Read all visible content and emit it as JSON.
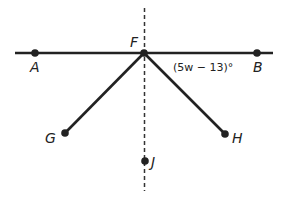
{
  "diagram": {
    "colors": {
      "line": "#222222",
      "background": "#ffffff"
    },
    "points": {
      "A": {
        "label": "A",
        "x": 35,
        "y": 53
      },
      "B": {
        "label": "B",
        "x": 257,
        "y": 53
      },
      "F": {
        "label": "F",
        "x": 144,
        "y": 53
      },
      "G": {
        "label": "G",
        "x": 65,
        "y": 133
      },
      "H": {
        "label": "H",
        "x": 225,
        "y": 134
      },
      "J": {
        "label": "J",
        "x": 145,
        "y": 161
      }
    },
    "segments": [
      {
        "name": "line-AB",
        "from": "A",
        "to": "B",
        "style": "solid"
      },
      {
        "name": "ray-FG",
        "from": "F",
        "to": "G",
        "style": "solid"
      },
      {
        "name": "ray-FH",
        "from": "F",
        "to": "H",
        "style": "solid"
      },
      {
        "name": "line-FJ",
        "from": "F",
        "to": "J",
        "style": "dashed"
      }
    ],
    "angle_annotation": "(5w − 13)°"
  }
}
